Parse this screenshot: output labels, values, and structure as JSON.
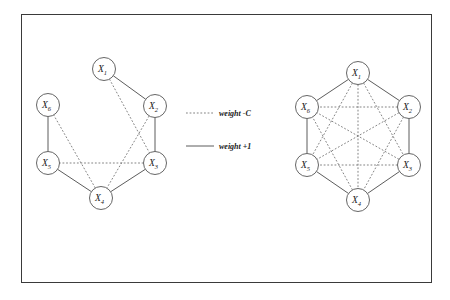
{
  "figure": {
    "background_color": "#ffffff",
    "frame_color": "#3a3a3a",
    "solid_edge_color": "#4a4a4a",
    "dashed_edge_color": "#6e6e6e",
    "node_fill_color": "#ffffff",
    "node_stroke_color": "#555555"
  },
  "legend": {
    "items": [
      {
        "style": "dashed",
        "label": "weight -C"
      },
      {
        "style": "solid",
        "label": "weight +1"
      }
    ]
  },
  "graphs": [
    {
      "id": "left-graph",
      "name": "irregular-graph",
      "nodes": [
        {
          "id": "X1",
          "base": "X",
          "sub": "1",
          "cx": 104,
          "cy": 69,
          "r": 11.5
        },
        {
          "id": "X2",
          "base": "X",
          "sub": "2",
          "cx": 155,
          "cy": 106,
          "r": 11.5
        },
        {
          "id": "X3",
          "base": "X",
          "sub": "3",
          "cx": 155,
          "cy": 163,
          "r": 11.5
        },
        {
          "id": "X4",
          "base": "X",
          "sub": "4",
          "cx": 101,
          "cy": 198,
          "r": 11.5
        },
        {
          "id": "X5",
          "base": "X",
          "sub": "5",
          "cx": 48,
          "cy": 163,
          "r": 11.5
        },
        {
          "id": "X6",
          "base": "X",
          "sub": "6",
          "cx": 48,
          "cy": 105,
          "r": 11.5
        }
      ],
      "edges": [
        {
          "from": "X1",
          "to": "X2",
          "style": "solid"
        },
        {
          "from": "X2",
          "to": "X3",
          "style": "solid"
        },
        {
          "from": "X3",
          "to": "X4",
          "style": "solid"
        },
        {
          "from": "X4",
          "to": "X5",
          "style": "solid"
        },
        {
          "from": "X5",
          "to": "X6",
          "style": "solid"
        },
        {
          "from": "X1",
          "to": "X3",
          "style": "dashed"
        },
        {
          "from": "X2",
          "to": "X4",
          "style": "dashed"
        },
        {
          "from": "X3",
          "to": "X5",
          "style": "dashed"
        },
        {
          "from": "X4",
          "to": "X6",
          "style": "dashed"
        }
      ]
    },
    {
      "id": "right-graph",
      "name": "complete-hexagon-graph",
      "nodes": [
        {
          "id": "X1",
          "base": "X",
          "sub": "1",
          "cx": 358,
          "cy": 73,
          "r": 11.5
        },
        {
          "id": "X2",
          "base": "X",
          "sub": "2",
          "cx": 409,
          "cy": 107,
          "r": 11.5
        },
        {
          "id": "X3",
          "base": "X",
          "sub": "3",
          "cx": 409,
          "cy": 165,
          "r": 11.5
        },
        {
          "id": "X4",
          "base": "X",
          "sub": "4",
          "cx": 358,
          "cy": 200,
          "r": 11.5
        },
        {
          "id": "X5",
          "base": "X",
          "sub": "5",
          "cx": 307,
          "cy": 165,
          "r": 11.5
        },
        {
          "id": "X6",
          "base": "X",
          "sub": "6",
          "cx": 307,
          "cy": 107,
          "r": 11.5
        }
      ],
      "edges": [
        {
          "from": "X1",
          "to": "X2",
          "style": "solid"
        },
        {
          "from": "X2",
          "to": "X3",
          "style": "solid"
        },
        {
          "from": "X3",
          "to": "X4",
          "style": "solid"
        },
        {
          "from": "X4",
          "to": "X5",
          "style": "solid"
        },
        {
          "from": "X5",
          "to": "X6",
          "style": "solid"
        },
        {
          "from": "X6",
          "to": "X1",
          "style": "solid"
        },
        {
          "from": "X1",
          "to": "X3",
          "style": "dashed"
        },
        {
          "from": "X1",
          "to": "X4",
          "style": "dashed"
        },
        {
          "from": "X1",
          "to": "X5",
          "style": "dashed"
        },
        {
          "from": "X2",
          "to": "X4",
          "style": "dashed"
        },
        {
          "from": "X2",
          "to": "X5",
          "style": "dashed"
        },
        {
          "from": "X2",
          "to": "X6",
          "style": "dashed"
        },
        {
          "from": "X3",
          "to": "X5",
          "style": "dashed"
        },
        {
          "from": "X3",
          "to": "X6",
          "style": "dashed"
        },
        {
          "from": "X4",
          "to": "X6",
          "style": "dashed"
        }
      ]
    }
  ],
  "legend_geometry": {
    "dashed_line": {
      "x1": 186,
      "y1": 113,
      "x2": 214,
      "y2": 113
    },
    "dashed_label": {
      "x": 219,
      "y": 113
    },
    "solid_line": {
      "x1": 186,
      "y1": 146,
      "x2": 214,
      "y2": 146
    },
    "solid_label": {
      "x": 219,
      "y": 146
    }
  }
}
